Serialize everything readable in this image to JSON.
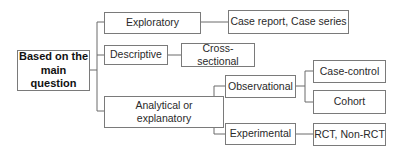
{
  "diagram": {
    "type": "tree",
    "root": {
      "label": "Based on the main question"
    },
    "nodes": {
      "exploratory": {
        "label": "Exploratory"
      },
      "case_report": {
        "label": "Case report, Case series"
      },
      "descriptive": {
        "label": "Descriptive"
      },
      "cross_sectional": {
        "label": "Cross-sectional"
      },
      "analytical": {
        "label": "Analytical or explanatory"
      },
      "observational": {
        "label": "Observational"
      },
      "case_control": {
        "label": "Case-control"
      },
      "cohort": {
        "label": "Cohort"
      },
      "experimental": {
        "label": "Experimental"
      },
      "rct": {
        "label": "RCT, Non-RCT"
      }
    },
    "edges": [
      [
        "root",
        "exploratory"
      ],
      [
        "root",
        "descriptive"
      ],
      [
        "root",
        "analytical"
      ],
      [
        "exploratory",
        "case_report"
      ],
      [
        "descriptive",
        "cross_sectional"
      ],
      [
        "analytical",
        "observational"
      ],
      [
        "analytical",
        "experimental"
      ],
      [
        "observational",
        "case_control"
      ],
      [
        "observational",
        "cohort"
      ],
      [
        "experimental",
        "rct"
      ]
    ],
    "colors": {
      "border": "#7a7a7a",
      "line": "#6a6a6a",
      "text": "#2a2a2a",
      "background": "#ffffff"
    }
  }
}
